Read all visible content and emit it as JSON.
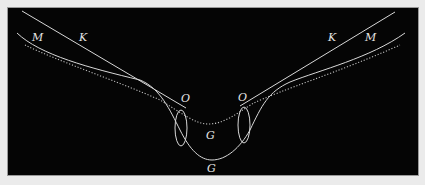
{
  "diagram": {
    "background": "#050505",
    "stroke_color": "#d8d8d8",
    "labels": [
      {
        "id": "M-left",
        "text": "M",
        "x": 32,
        "y": 32
      },
      {
        "id": "K-left",
        "text": "K",
        "x": 79,
        "y": 32
      },
      {
        "id": "K-right",
        "text": "K",
        "x": 328,
        "y": 32
      },
      {
        "id": "M-right",
        "text": "M",
        "x": 365,
        "y": 32
      },
      {
        "id": "O-left",
        "text": "O",
        "x": 181,
        "y": 93
      },
      {
        "id": "O-right",
        "text": "O",
        "x": 238,
        "y": 92
      },
      {
        "id": "G-upper",
        "text": "G",
        "x": 206,
        "y": 130
      },
      {
        "id": "G-lower",
        "text": "G",
        "x": 207,
        "y": 163
      }
    ],
    "curves": [
      {
        "id": "K-line-left",
        "type": "line"
      },
      {
        "id": "K-line-right",
        "type": "line"
      },
      {
        "id": "M-curve",
        "type": "solid-curve"
      },
      {
        "id": "dotted-curve",
        "type": "dotted-curve"
      },
      {
        "id": "ellipse-left",
        "type": "ellipse"
      },
      {
        "id": "ellipse-right",
        "type": "ellipse"
      }
    ]
  }
}
